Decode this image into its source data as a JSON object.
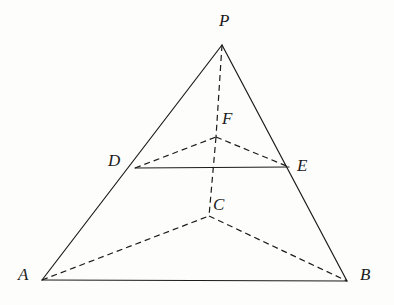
{
  "figure": {
    "kind": "geometry-diagram",
    "canvas": {
      "width": 394,
      "height": 305
    },
    "background_color": "#fdfdfc",
    "stroke_color": "#1b1b1b",
    "stroke_width": 1.2,
    "dash_pattern": "6 4"
  },
  "points": {
    "P": {
      "label": "P",
      "x": 222,
      "y": 45,
      "label_x": 219,
      "label_y": 12
    },
    "A": {
      "label": "A",
      "x": 42,
      "y": 280,
      "label_x": 18,
      "label_y": 266
    },
    "B": {
      "label": "B",
      "x": 347,
      "y": 281,
      "label_x": 360,
      "label_y": 266
    },
    "C": {
      "label": "C",
      "x": 209,
      "y": 216,
      "label_x": 213,
      "label_y": 196
    },
    "D": {
      "label": "D",
      "x": 135,
      "y": 168,
      "label_x": 108,
      "label_y": 152
    },
    "E": {
      "label": "E",
      "x": 289,
      "y": 167,
      "label_x": 297,
      "label_y": 157
    },
    "F": {
      "label": "F",
      "x": 216,
      "y": 137,
      "label_x": 222,
      "label_y": 110
    }
  },
  "edges": {
    "solid": [
      {
        "name": "edge-PA",
        "from": "P",
        "to": "A"
      },
      {
        "name": "edge-PB",
        "from": "P",
        "to": "B"
      },
      {
        "name": "edge-AB",
        "from": "A",
        "to": "B"
      },
      {
        "name": "edge-DE",
        "from": "D",
        "to": "E"
      }
    ],
    "dashed": [
      {
        "name": "edge-PF",
        "from": "P",
        "to": "F"
      },
      {
        "name": "edge-FC",
        "from": "F",
        "to": "C"
      },
      {
        "name": "edge-DF",
        "from": "D",
        "to": "F"
      },
      {
        "name": "edge-FE",
        "from": "F",
        "to": "E"
      },
      {
        "name": "edge-AC",
        "from": "A",
        "to": "C"
      },
      {
        "name": "edge-CB",
        "from": "C",
        "to": "B"
      }
    ]
  }
}
